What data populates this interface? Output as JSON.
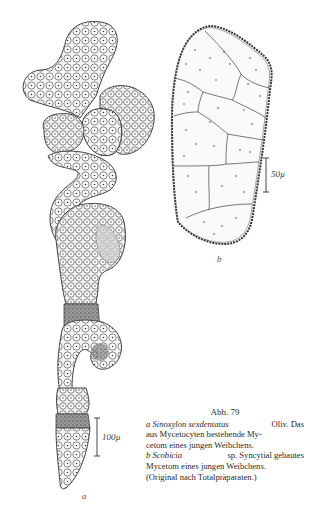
{
  "figure": {
    "number": "Abb. 79",
    "panels": [
      {
        "id": "a",
        "label": "a",
        "scale_bar": "100µ"
      },
      {
        "id": "b",
        "label": "b",
        "scale_bar": "50µ"
      }
    ]
  },
  "caption": {
    "title": "Abb. 79",
    "line1": {
      "label": "a",
      "species": "Sinoxylon sexdentatus",
      "rest": "Oliv. Das"
    },
    "line2": "aus Mycetocyten bestehende My-",
    "line3": "cetom eines jungen Weibchens.",
    "line4": {
      "label": "b",
      "species": "Scobicia",
      "rest": "sp. Syncytial gebautes"
    },
    "line5": "Mycetom eines jungen Weibchens.",
    "line6": "(Original nach Totalpräparaten.)"
  }
}
